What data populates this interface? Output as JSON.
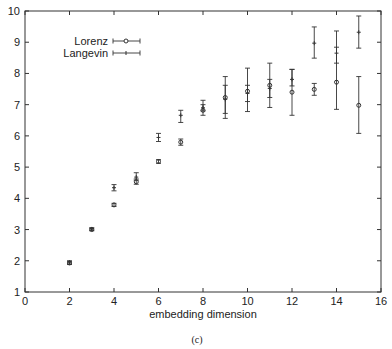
{
  "chart_data": {
    "type": "scatter",
    "title": "",
    "caption": "(c)",
    "xlabel": "embedding dimension",
    "ylabel": "",
    "xlim": [
      0,
      16
    ],
    "ylim": [
      1,
      10
    ],
    "xticks": [
      0,
      2,
      4,
      6,
      8,
      10,
      12,
      14,
      16
    ],
    "yticks": [
      1,
      2,
      3,
      4,
      5,
      6,
      7,
      8,
      9,
      10
    ],
    "grid": false,
    "legend_position": "upper-left",
    "series": [
      {
        "name": "Lorenz",
        "marker": "circle",
        "x": [
          2,
          3,
          4,
          5,
          6,
          7,
          8,
          9,
          10,
          11,
          12,
          13,
          14,
          15
        ],
        "y": [
          1.93,
          3.0,
          3.79,
          4.53,
          5.18,
          5.8,
          6.82,
          7.23,
          7.43,
          7.62,
          7.4,
          7.49,
          7.72,
          6.98
        ],
        "err_low": [
          1.88,
          2.96,
          3.74,
          4.45,
          5.12,
          5.7,
          6.66,
          6.56,
          6.78,
          6.91,
          6.66,
          7.3,
          6.85,
          6.08
        ],
        "err_high": [
          1.98,
          3.04,
          3.84,
          4.62,
          5.24,
          5.9,
          7.14,
          7.9,
          8.17,
          8.33,
          8.13,
          7.68,
          9.36,
          7.9
        ]
      },
      {
        "name": "Langevin",
        "marker": "plus",
        "x": [
          2,
          3,
          4,
          5,
          6,
          7,
          8,
          9,
          10,
          11,
          12,
          13,
          14,
          15
        ],
        "y": [
          1.95,
          3.02,
          4.34,
          4.68,
          5.95,
          6.66,
          6.9,
          7.17,
          7.36,
          7.52,
          7.81,
          8.97,
          8.65,
          9.32
        ],
        "err_low": [
          1.9,
          2.98,
          4.24,
          4.58,
          5.82,
          6.43,
          6.8,
          6.72,
          7.1,
          7.23,
          7.6,
          8.49,
          8.33,
          8.81
        ],
        "err_high": [
          2.0,
          3.06,
          4.44,
          4.82,
          6.08,
          6.82,
          7.0,
          7.62,
          7.62,
          7.81,
          8.13,
          9.49,
          8.84,
          9.84
        ]
      }
    ]
  }
}
